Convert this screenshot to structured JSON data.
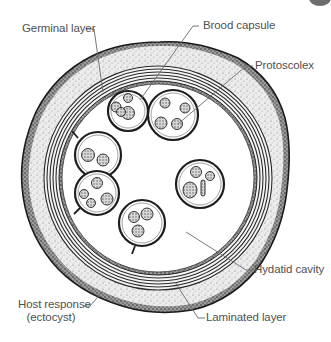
{
  "figure": {
    "colors": {
      "label_text": "#505050",
      "leader_line": "#6a6a6a",
      "outline": "#222222",
      "stipple_fill": "#e4e4e4",
      "cavity": "#ffffff"
    }
  },
  "labels": {
    "germinal_layer": "Germinal layer",
    "brood_capsule": "Brood capsule",
    "protoscolex": "Protoscolex",
    "hydatid_cavity": "Hydatid cavity",
    "laminated_layer": "Laminated layer",
    "host_response_line1": "Host response",
    "host_response_line2": "(ectocyst)"
  },
  "structures": [
    "Host response (ectocyst)",
    "Laminated layer",
    "Germinal layer",
    "Hydatid cavity",
    "Brood capsule",
    "Protoscolex"
  ]
}
